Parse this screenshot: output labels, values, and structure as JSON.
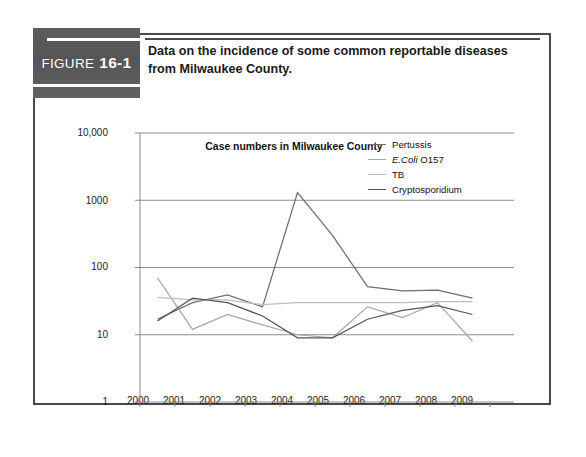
{
  "figure": {
    "badge_word": "FIGURE",
    "badge_number": "16-1",
    "caption": "Data on the incidence of some common reportable diseases from Milwaukee County."
  },
  "chart_data": {
    "type": "line",
    "title": "Case numbers in Milwaukee County",
    "xlabel": "",
    "ylabel": "",
    "yscale": "log",
    "ylim": [
      1,
      10000
    ],
    "ytick_labels": [
      "10,000",
      "1000",
      "100",
      "10",
      "1"
    ],
    "ytick_values": [
      10000,
      1000,
      100,
      10,
      1
    ],
    "grid": true,
    "legend_position": "inside top-right",
    "x": [
      2000,
      2001,
      2002,
      2003,
      2004,
      2005,
      2006,
      2007,
      2008,
      2009
    ],
    "categories": [
      "2000",
      "2001",
      "2002",
      "2003",
      "2004",
      "2005",
      "2006",
      "2007",
      "2008",
      "2009"
    ],
    "series": [
      {
        "name": "Pertussis",
        "color": "#6e6e6e",
        "values": [
          17,
          30,
          39,
          26,
          1300,
          300,
          52,
          45,
          46,
          35
        ]
      },
      {
        "name": "E.Coli O157",
        "name_italic_part": "E.Coli",
        "color": "#a8a8a8",
        "values": [
          70,
          12,
          20,
          14,
          10,
          9,
          26,
          18,
          30,
          8
        ]
      },
      {
        "name": "TB",
        "color": "#bdbdbd",
        "values": [
          36,
          33,
          33,
          28,
          30,
          30,
          30,
          30,
          31,
          31
        ]
      },
      {
        "name": "Cryptosporidium",
        "color": "#555555",
        "values": [
          16,
          35,
          30,
          19,
          9,
          9,
          17,
          23,
          27,
          20
        ]
      }
    ]
  },
  "colors": {
    "badge_bg": "#585858",
    "frame": "#4a4a4a",
    "grid": "#808080",
    "text": "#111111"
  }
}
